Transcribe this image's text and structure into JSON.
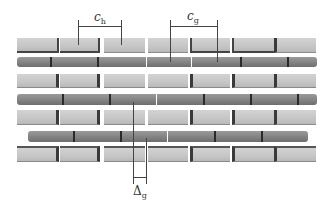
{
  "labels": {
    "ch": {
      "main": "c",
      "sub": "h"
    },
    "cg": {
      "main": "c",
      "sub": "g"
    },
    "dg": {
      "main": "Δ",
      "sub": "g"
    }
  },
  "colors": {
    "brick_light": "#c8c8c8",
    "rod_dark": "#858585",
    "shadow": "#3a3a3a",
    "dimension_line": "#444444"
  },
  "rows": [
    {
      "type": "brick",
      "y": 38,
      "h": 15
    },
    {
      "type": "rod",
      "y": 57,
      "h": 10
    },
    {
      "type": "brick",
      "y": 74,
      "h": 14
    },
    {
      "type": "rod",
      "y": 94,
      "h": 11
    },
    {
      "type": "brick",
      "y": 110,
      "h": 15
    },
    {
      "type": "rod",
      "y": 131,
      "h": 11
    },
    {
      "type": "brick",
      "y": 146,
      "h": 16
    }
  ]
}
